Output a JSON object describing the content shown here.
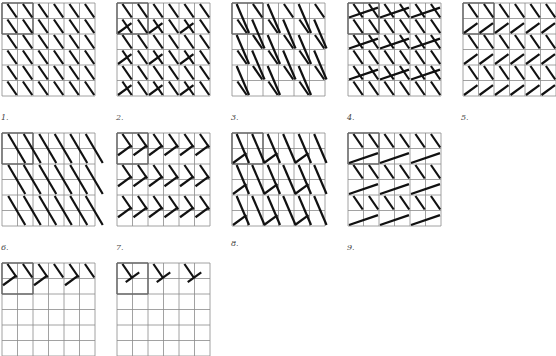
{
  "figure": {
    "grid_cells": 6,
    "cell_size": 15.5,
    "grid_line_color": "#8a8a8a",
    "stroke_color": "#111111",
    "panels": [
      {
        "id": "1",
        "label": "1.",
        "x": 2,
        "y": 3,
        "motif": "single"
      },
      {
        "id": "2",
        "label": "2.",
        "x": 117,
        "y": 3,
        "motif": "alt-v"
      },
      {
        "id": "3",
        "label": "3.",
        "x": 232,
        "y": 3,
        "motif": "long-mix"
      },
      {
        "id": "4",
        "label": "4.",
        "x": 348,
        "y": 3,
        "motif": "v2"
      },
      {
        "id": "5",
        "label": "5.",
        "x": 463,
        "y": 3,
        "motif": "v-all"
      },
      {
        "id": "6",
        "label": "6.",
        "x": 2,
        "y": 133,
        "motif": "long"
      },
      {
        "id": "7",
        "label": "7.",
        "x": 117,
        "y": 133,
        "motif": "chevron"
      },
      {
        "id": "8",
        "label": "8.",
        "x": 232,
        "y": 133,
        "motif": "long-v"
      },
      {
        "id": "9",
        "label": "9.",
        "x": 348,
        "y": 133,
        "motif": "big-v"
      },
      {
        "id": "10",
        "label": "",
        "x": 2,
        "y": 263,
        "motif": "partial-a"
      },
      {
        "id": "11",
        "label": "",
        "x": 117,
        "y": 263,
        "motif": "partial-b"
      }
    ],
    "labels": [
      {
        "text": "1.",
        "x": 1,
        "y": 113
      },
      {
        "text": "2.",
        "x": 116,
        "y": 113
      },
      {
        "text": "3.",
        "x": 231,
        "y": 113
      },
      {
        "text": "4.",
        "x": 347,
        "y": 113
      },
      {
        "text": "5.",
        "x": 461,
        "y": 113
      },
      {
        "text": "6.",
        "x": 1,
        "y": 243
      },
      {
        "text": "7.",
        "x": 116,
        "y": 243
      },
      {
        "text": "8.",
        "x": 231,
        "y": 239
      },
      {
        "text": "9.",
        "x": 347,
        "y": 243
      }
    ]
  }
}
